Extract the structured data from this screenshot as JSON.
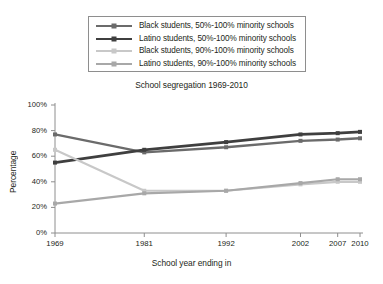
{
  "chart_data": {
    "type": "line",
    "title": "School segregation 1969-2010",
    "xlabel": "School year ending in",
    "ylabel": "Percentage",
    "x": [
      1969,
      1981,
      1992,
      2002,
      2007,
      2010
    ],
    "xtick_labels": [
      "1969",
      "1981",
      "1992",
      "2002",
      "2007",
      "2010"
    ],
    "ytick_labels": [
      "0%",
      "20%",
      "40%",
      "60%",
      "80%",
      "100%"
    ],
    "ytick_values": [
      0,
      20,
      40,
      60,
      80,
      100
    ],
    "ylim": [
      0,
      100
    ],
    "xlim": [
      1969,
      2010
    ],
    "grid": false,
    "legend_position": "above-plot",
    "series": [
      {
        "name": "Black students, 50%-100% minority schools",
        "color": "#6b6b6b",
        "values": [
          77,
          63,
          67,
          72,
          73,
          74
        ]
      },
      {
        "name": "Latino students, 50%-100% minority schools",
        "color": "#3f3f3f",
        "values": [
          55,
          65,
          71,
          77,
          78,
          79
        ]
      },
      {
        "name": "Black students, 90%-100% minority schools",
        "color": "#c8c8c8",
        "values": [
          65,
          33,
          33,
          38,
          40,
          40
        ]
      },
      {
        "name": "Latino students, 90%-100% minority schools",
        "color": "#a8a8a8",
        "values": [
          23,
          31,
          33,
          39,
          42,
          42
        ]
      }
    ]
  },
  "legend": {
    "items": [
      {
        "label": "Black students, 50%-100% minority schools",
        "color": "#6b6b6b"
      },
      {
        "label": "Latino students, 50%-100% minority schools",
        "color": "#3f3f3f"
      },
      {
        "label": "Black students, 90%-100% minority schools",
        "color": "#c8c8c8"
      },
      {
        "label": "Latino students, 90%-100% minority schools",
        "color": "#a8a8a8"
      }
    ]
  },
  "axis": {
    "color": "#8e8e8e"
  }
}
